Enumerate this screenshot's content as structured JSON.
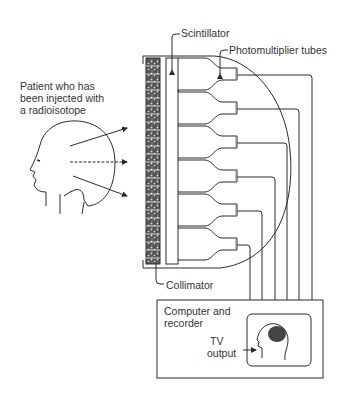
{
  "labels": {
    "patient": [
      "Patient who has",
      "been injected with",
      "a radioisotope"
    ],
    "scintillator": "Scintillator",
    "photomultiplier": "Photomultiplier tubes",
    "collimator": "Collimator",
    "computer": [
      "Computer and",
      "recorder"
    ],
    "tv": [
      "TV",
      "output"
    ]
  },
  "colors": {
    "line": "#2a2a2a",
    "background": "#ffffff"
  },
  "diagram": {
    "type": "gamma-camera schematic",
    "tube_count": 6,
    "wire_count": 6
  }
}
